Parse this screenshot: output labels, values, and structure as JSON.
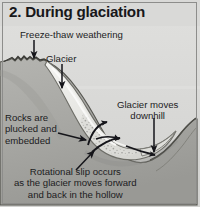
{
  "figure": {
    "title": "2. During glaciation",
    "background_color": "#d4d4d2",
    "ink_color": "#1c1c1e"
  },
  "labels": {
    "freeze_thaw": "Freeze-thaw weathering",
    "glacier": "Glacier",
    "rocks_plucked": "Rocks are\nplucked and\nembedded",
    "rocks_plucked_line1": "Rocks are",
    "rocks_plucked_line2": "plucked and",
    "rocks_plucked_line3": "embedded",
    "glacier_moves_line1": "Glacier moves",
    "glacier_moves_line2": "downhill",
    "rotational_line1": "Rotational slip occurs",
    "rotational_line2": "as the glacier moves forward",
    "rotational_line3": "and back in the hollow"
  },
  "icons": {
    "arrow_freeze_thaw": "down-arrow-icon",
    "arrow_glacier": "down-arrow-icon",
    "arrow_rocks": "right-arrow-icon",
    "arrow_downhill": "down-arrow-icon",
    "arrow_rotational": "up-left-arrow-icon",
    "rotational_flow": "curved-rotation-arrow-icon"
  },
  "diagram": {
    "rock_fill": "#a9a9a6",
    "rock_edge": "#4a4a48",
    "glacier_fill": "#e9e9e6",
    "glacier_speckle": "#9c9c98",
    "sky_fill": "#d9d9d7",
    "features": [
      "back-wall-rock-face",
      "freeze-thaw-jagged-crest",
      "glacier-ice-mass",
      "rotational-slip-arrows",
      "glacier-snout",
      "rock-lip-threshold"
    ]
  }
}
